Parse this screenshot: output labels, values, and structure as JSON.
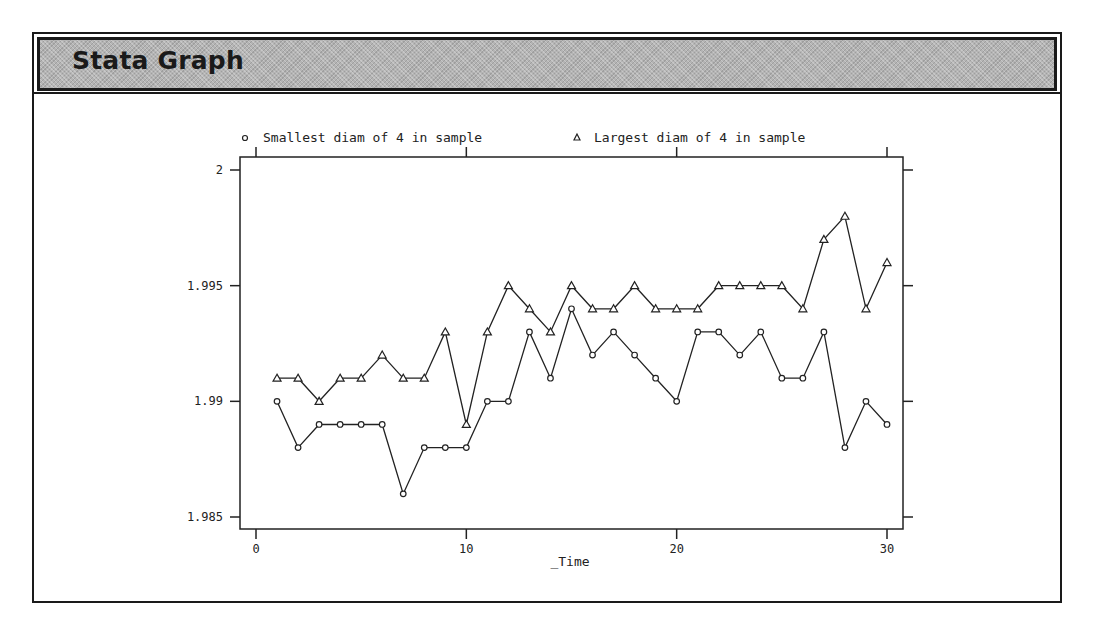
{
  "window": {
    "title": "Stata Graph"
  },
  "chart_data": {
    "type": "line",
    "title": "",
    "xlabel": "_Time",
    "ylabel": "",
    "xlim": [
      0,
      30
    ],
    "ylim": [
      1.985,
      2.0
    ],
    "x_ticks": [
      0,
      10,
      20,
      30
    ],
    "x_tick_labels": [
      "0",
      "10",
      "20",
      "30"
    ],
    "y_ticks": [
      1.985,
      1.99,
      1.995,
      2.0
    ],
    "y_tick_labels": [
      "1.985",
      "1.99",
      "1.995",
      "2"
    ],
    "grid": false,
    "legend_position": "top",
    "x": [
      1,
      2,
      3,
      4,
      5,
      6,
      7,
      8,
      9,
      10,
      11,
      12,
      13,
      14,
      15,
      16,
      17,
      18,
      19,
      20,
      21,
      22,
      23,
      24,
      25,
      26,
      27,
      28,
      29,
      30
    ],
    "series": [
      {
        "name": "Smallest diam of 4 in sample",
        "marker": "circle",
        "values": [
          1.99,
          1.988,
          1.989,
          1.989,
          1.989,
          1.989,
          1.986,
          1.988,
          1.988,
          1.988,
          1.99,
          1.99,
          1.993,
          1.991,
          1.994,
          1.992,
          1.993,
          1.992,
          1.991,
          1.99,
          1.993,
          1.993,
          1.992,
          1.993,
          1.991,
          1.991,
          1.993,
          1.988,
          1.99,
          1.989
        ]
      },
      {
        "name": "Largest diam of 4 in sample",
        "marker": "triangle",
        "values": [
          1.991,
          1.991,
          1.99,
          1.991,
          1.991,
          1.992,
          1.991,
          1.991,
          1.993,
          1.989,
          1.993,
          1.995,
          1.994,
          1.993,
          1.995,
          1.994,
          1.994,
          1.995,
          1.994,
          1.994,
          1.994,
          1.995,
          1.995,
          1.995,
          1.995,
          1.994,
          1.997,
          1.998,
          1.994,
          1.996
        ]
      }
    ],
    "legend": {
      "items": [
        {
          "symbol": "○",
          "label": "Smallest diam of 4 in sample"
        },
        {
          "symbol": "▵",
          "label": "Largest diam of 4 in sample"
        }
      ]
    },
    "colors": {
      "line": "#222222",
      "axis": "#222222"
    }
  }
}
